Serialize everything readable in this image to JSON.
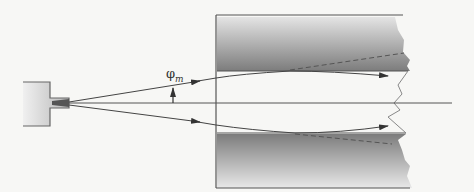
{
  "figure": {
    "type": "optical waveguide ray diagram",
    "angle_label": {
      "symbol": "φ",
      "subscript": "m"
    },
    "colors": {
      "background": "#f7f7f5",
      "line": "#555555",
      "slab_dark": "#7a7a7a",
      "slab_light": "#e6e6e6",
      "source_fill": "#c8c8c8"
    }
  }
}
